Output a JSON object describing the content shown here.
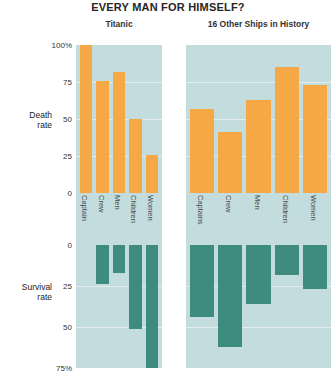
{
  "title": "EVERY MAN FOR HIMSELF?",
  "panels": [
    {
      "id": "titanic",
      "title": "Titanic"
    },
    {
      "id": "other",
      "title": "16 Other Ships in History"
    }
  ],
  "axes": {
    "death_label": "Death\nrate",
    "survival_label": "Survival\nrate",
    "death_ticks": [
      "100%",
      "75",
      "50",
      "25",
      "0"
    ],
    "survival_ticks": [
      "0",
      "25",
      "50",
      "75%"
    ]
  },
  "colors": {
    "death": "#f5a843",
    "survival": "#3d8c7f",
    "panel_background": "#c3dcdd",
    "gridline": "#e8f0ef",
    "page_background": "#ffffff",
    "text": "#2b2b2b"
  },
  "chart_data": {
    "type": "bar",
    "title": "EVERY MAN FOR HIMSELF?",
    "xlabel": "",
    "ylabel": "Death rate / Survival rate",
    "grid": true,
    "legend": "none",
    "units": "percent",
    "panels": [
      {
        "name": "Titanic",
        "categories": [
          "Captain",
          "Crew",
          "Men",
          "Children",
          "Women"
        ],
        "series": [
          {
            "name": "Death rate",
            "ylim": [
              0,
              100
            ],
            "values": [
              100,
              76,
              82,
              50,
              26
            ]
          },
          {
            "name": "Survival rate",
            "ylim": [
              0,
              75
            ],
            "values": [
              0,
              24,
              17,
              51,
              75
            ]
          }
        ]
      },
      {
        "name": "16 Other Ships in History",
        "categories": [
          "Captains",
          "Crew",
          "Men",
          "Children",
          "Women"
        ],
        "series": [
          {
            "name": "Death rate",
            "ylim": [
              0,
              100
            ],
            "values": [
              57,
              41,
              63,
              85,
              73
            ]
          },
          {
            "name": "Survival rate",
            "ylim": [
              0,
              75
            ],
            "values": [
              44,
              62,
              36,
              18,
              27
            ]
          }
        ]
      }
    ]
  }
}
